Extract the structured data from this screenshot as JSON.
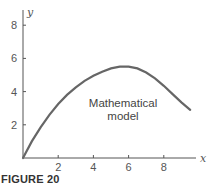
{
  "figure_caption": "FIGURE 20",
  "chart_data": {
    "type": "line",
    "title": "",
    "xlabel": "x",
    "ylabel": "y",
    "xlim": [
      0,
      9.8
    ],
    "ylim": [
      0,
      8.8
    ],
    "x_ticks": [
      2,
      4,
      6,
      8
    ],
    "y_ticks": [
      2,
      4,
      6,
      8
    ],
    "grid": false,
    "legend": null,
    "annotations": [
      {
        "text": "Mathematical model",
        "x": 5.5,
        "y": 3.3
      }
    ],
    "series": [
      {
        "name": "Mathematical model",
        "color": "#666666",
        "x": [
          0,
          0.5,
          1,
          1.5,
          2,
          2.5,
          3,
          3.5,
          4,
          4.5,
          5,
          5.5,
          6,
          6.5,
          7,
          7.5,
          8,
          8.5,
          9,
          9.5
        ],
        "y": [
          0,
          1.0,
          1.85,
          2.6,
          3.25,
          3.8,
          4.25,
          4.65,
          4.95,
          5.2,
          5.4,
          5.5,
          5.5,
          5.4,
          5.15,
          4.8,
          4.35,
          3.85,
          3.35,
          2.9
        ]
      }
    ]
  }
}
